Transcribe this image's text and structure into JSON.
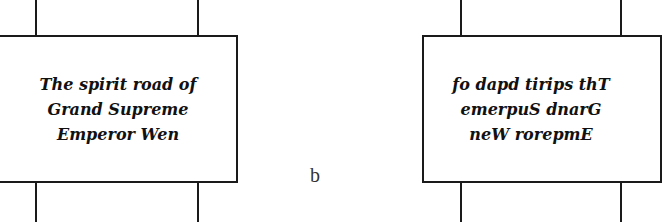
{
  "left_panel": {
    "lines": [
      "The spirit road of",
      "Grand Supreme",
      "Emperor Wen"
    ]
  },
  "right_panel": {
    "lines": [
      "fo dapd tirips thT",
      "emerpuS dnarG",
      "neW rorepmE"
    ]
  },
  "caption": "b",
  "colors": {
    "stroke": "#1a1a1a",
    "background": "#ffffff"
  }
}
